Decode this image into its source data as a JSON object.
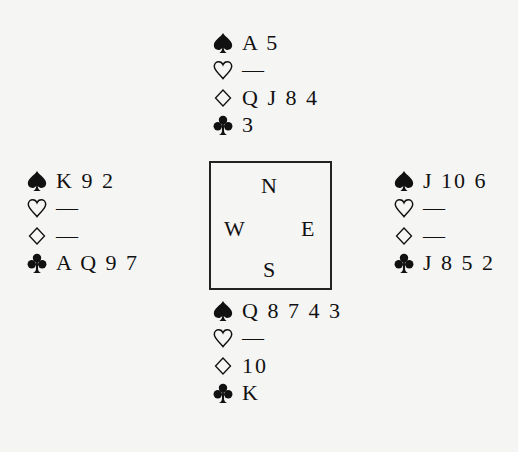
{
  "deal": {
    "north": {
      "spades": "A 5",
      "hearts": "—",
      "diamonds": "Q J 8 4",
      "clubs": "3"
    },
    "west": {
      "spades": "K 9 2",
      "hearts": "—",
      "diamonds": "—",
      "clubs": "A Q 9 7"
    },
    "east": {
      "spades": "J 10 6",
      "hearts": "—",
      "diamonds": "—",
      "clubs": "J 8 5 2"
    },
    "south": {
      "spades": "Q 8 7 4 3",
      "hearts": "—",
      "diamonds": "10",
      "clubs": "K"
    }
  },
  "compass": {
    "north": "N",
    "west": "W",
    "east": "E",
    "south": "S"
  },
  "suit_icons": [
    "spade-icon",
    "heart-icon",
    "diamond-icon",
    "club-icon"
  ]
}
